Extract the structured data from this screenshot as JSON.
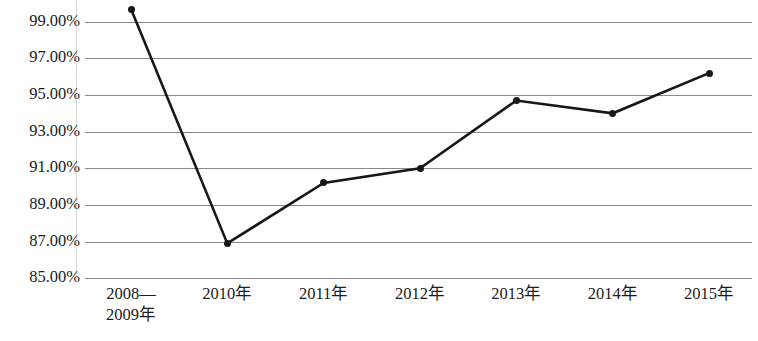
{
  "chart_data": {
    "type": "line",
    "title": "",
    "subtitle": "",
    "xlabel": "",
    "ylabel": "",
    "categories": [
      "2008—\n2009年",
      "2010年",
      "2011年",
      "2012年",
      "2013年",
      "2014年",
      "2015年"
    ],
    "category_lines": [
      [
        "2008—",
        "2009年"
      ],
      [
        "2010年"
      ],
      [
        "2011年"
      ],
      [
        "2012年"
      ],
      [
        "2013年"
      ],
      [
        "2014年"
      ],
      [
        "2015年"
      ]
    ],
    "series": [
      {
        "name": "",
        "values": [
          99.7,
          86.9,
          90.2,
          91.0,
          94.7,
          94.0,
          96.2
        ]
      }
    ],
    "values": [
      99.7,
      86.9,
      90.2,
      91.0,
      94.7,
      94.0,
      96.2
    ],
    "ylim": [
      85.0,
      100.0
    ],
    "ytick_values": [
      99.0,
      97.0,
      95.0,
      93.0,
      91.0,
      89.0,
      87.0,
      85.0
    ],
    "ytick_labels": [
      "99.00%",
      "97.00%",
      "95.00%",
      "93.00%",
      "91.00%",
      "89.00%",
      "87.00%",
      "85.00%"
    ],
    "grid": "horizontal",
    "legend": "none",
    "marker": "filled-circle",
    "line_color": "#171717",
    "grid_color": "#888888",
    "text_color": "#1b1b1b",
    "background_color": "#ffffff"
  }
}
